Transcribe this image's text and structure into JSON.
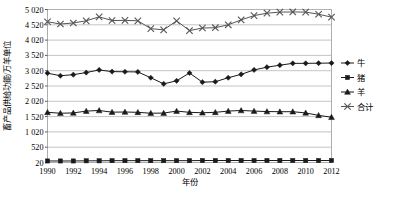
{
  "chart_data": {
    "type": "line",
    "title": "",
    "xlabel": "年份",
    "ylabel": "畜产品供给功能/万羊单位",
    "ylim": [
      20,
      5020
    ],
    "ytick_labels": [
      "20",
      "520",
      "1 020",
      "1 520",
      "2 020",
      "2 520",
      "3 020",
      "3 520",
      "4 020",
      "4 520",
      "5 020"
    ],
    "ytick_values": [
      20,
      520,
      1020,
      1520,
      2020,
      2520,
      3020,
      3520,
      4020,
      4520,
      5020
    ],
    "xtick_labels": [
      "1990",
      "1992",
      "1994",
      "1996",
      "1998",
      "2000",
      "2002",
      "2004",
      "2006",
      "2008",
      "2010",
      "2012"
    ],
    "x": [
      1990,
      1991,
      1992,
      1993,
      1994,
      1995,
      1996,
      1997,
      1998,
      1999,
      2000,
      2001,
      2002,
      2003,
      2004,
      2005,
      2006,
      2007,
      2008,
      2009,
      2010,
      2011,
      2012
    ],
    "grid": true,
    "legend_position": "right",
    "series": [
      {
        "name": "牛",
        "marker": "diamond",
        "color": "#1a1a1a",
        "values": [
          2940,
          2855,
          2890,
          2960,
          3045,
          2990,
          2985,
          2980,
          2790,
          2590,
          2690,
          2945,
          2645,
          2660,
          2790,
          2900,
          3045,
          3135,
          3200,
          3260,
          3260,
          3265,
          3270
        ]
      },
      {
        "name": "猪",
        "marker": "square",
        "color": "#1a1a1a",
        "values": [
          70,
          70,
          70,
          75,
          75,
          80,
          80,
          80,
          80,
          80,
          80,
          80,
          85,
          85,
          85,
          85,
          85,
          85,
          85,
          85,
          85,
          85,
          85
        ]
      },
      {
        "name": "羊",
        "marker": "triangle",
        "color": "#1a1a1a",
        "values": [
          1660,
          1630,
          1640,
          1700,
          1720,
          1665,
          1670,
          1660,
          1630,
          1635,
          1700,
          1660,
          1645,
          1660,
          1700,
          1720,
          1700,
          1685,
          1680,
          1680,
          1640,
          1560,
          1500
        ]
      },
      {
        "name": "合计",
        "marker": "cross",
        "color": "#555555",
        "values": [
          4620,
          4545,
          4580,
          4650,
          4780,
          4660,
          4665,
          4650,
          4395,
          4355,
          4650,
          4330,
          4415,
          4425,
          4520,
          4680,
          4820,
          4900,
          4935,
          4940,
          4935,
          4865,
          4770
        ]
      }
    ]
  }
}
